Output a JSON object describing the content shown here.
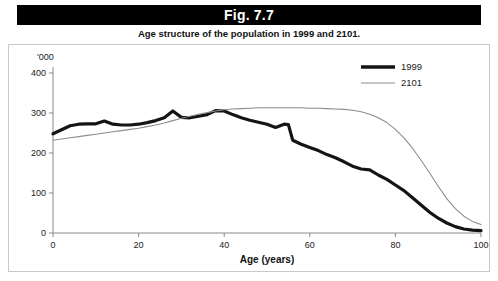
{
  "figure": {
    "title": "Fig. 7.7",
    "subtitle": "Age structure of the population in 1999 and 2101."
  },
  "chart_data": {
    "type": "line",
    "title": "Age structure of the population in 1999 and 2101.",
    "xlabel": "Age (years)",
    "ylabel": "'000",
    "unit_label": "'000",
    "xlim": [
      0,
      100
    ],
    "ylim": [
      0,
      400
    ],
    "xticks": [
      0,
      20,
      40,
      60,
      80,
      100
    ],
    "yticks": [
      0,
      100,
      200,
      300,
      400
    ],
    "grid": false,
    "legend_position": "top-right",
    "x": [
      0,
      2,
      4,
      6,
      8,
      10,
      12,
      14,
      16,
      18,
      20,
      22,
      24,
      26,
      28,
      30,
      32,
      34,
      36,
      38,
      40,
      42,
      44,
      46,
      48,
      50,
      52,
      54,
      55,
      56,
      58,
      60,
      62,
      64,
      66,
      68,
      70,
      72,
      74,
      76,
      78,
      80,
      82,
      84,
      86,
      88,
      90,
      92,
      94,
      96,
      98,
      100
    ],
    "series": [
      {
        "name": "1999",
        "color": "#141414",
        "width": 3.2,
        "values": [
          248,
          258,
          268,
          272,
          273,
          273,
          280,
          272,
          270,
          270,
          272,
          276,
          281,
          288,
          305,
          289,
          288,
          292,
          296,
          306,
          305,
          296,
          288,
          282,
          277,
          272,
          264,
          272,
          271,
          232,
          222,
          214,
          206,
          196,
          188,
          178,
          167,
          160,
          158,
          145,
          134,
          120,
          106,
          88,
          70,
          52,
          37,
          25,
          16,
          10,
          7,
          6
        ]
      },
      {
        "name": "2101",
        "color": "#8d8d8d",
        "width": 1.1,
        "values": [
          232,
          235,
          238,
          241,
          244,
          247,
          250,
          253,
          256,
          259,
          262,
          266,
          270,
          275,
          281,
          287,
          292,
          297,
          301,
          305,
          308,
          310,
          311,
          312,
          313,
          313,
          313,
          313,
          313,
          313,
          313,
          312,
          312,
          311,
          310,
          309,
          307,
          303,
          297,
          288,
          276,
          259,
          238,
          212,
          182,
          150,
          117,
          86,
          61,
          42,
          29,
          21
        ]
      }
    ],
    "legend": [
      {
        "label": "1999",
        "color": "#141414",
        "thick": true
      },
      {
        "label": "2101",
        "color": "#8d8d8d",
        "thick": false
      }
    ]
  }
}
